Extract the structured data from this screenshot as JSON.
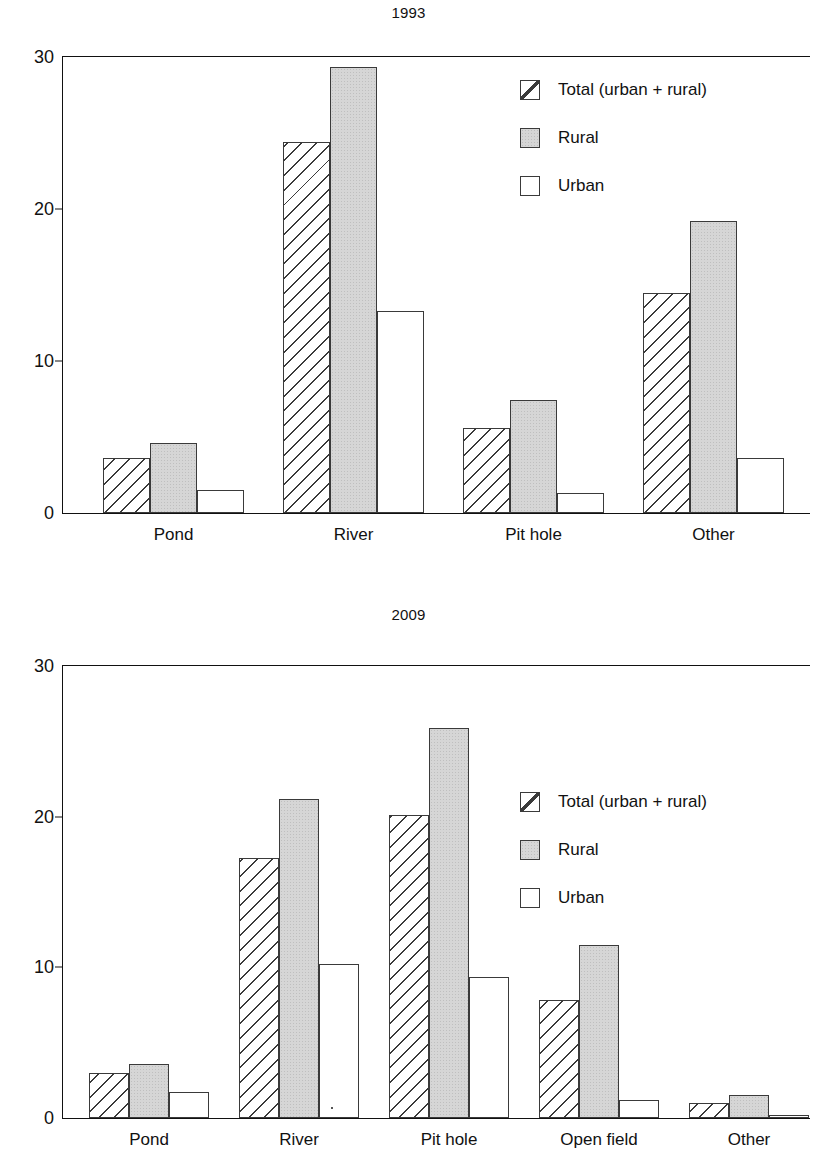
{
  "figures": [
    {
      "id": "1993",
      "title": "1993",
      "legend_position": "top-right"
    },
    {
      "id": "2009",
      "title": "2009",
      "legend_position": "top-right"
    }
  ],
  "legend": {
    "items": [
      {
        "key": "total",
        "label": "Total (urban + rural)",
        "swatch": "hatched-swatch"
      },
      {
        "key": "rural",
        "label": "Rural",
        "swatch": "gray-filled-swatch"
      },
      {
        "key": "urban",
        "label": "Urban",
        "swatch": "white-swatch"
      }
    ]
  },
  "axis": {
    "y_ticks": [
      "0",
      "10",
      "20",
      "30"
    ],
    "y_min": 0,
    "y_max": 30
  },
  "chart_data": [
    {
      "type": "bar",
      "title": "1993",
      "xlabel": "",
      "ylabel": "",
      "ylim": [
        0,
        30
      ],
      "yticks": [
        0,
        10,
        20,
        30
      ],
      "grid": false,
      "legend": "top right",
      "categories": [
        "Pond",
        "River",
        "Pit hole",
        "Other"
      ],
      "series": [
        {
          "name": "Total (urban + rural)",
          "values": [
            3.6,
            24.3,
            5.6,
            14.4
          ]
        },
        {
          "name": "Rural",
          "values": [
            4.6,
            29.2,
            7.4,
            19.1
          ]
        },
        {
          "name": "Urban",
          "values": [
            1.5,
            13.2,
            1.3,
            3.6
          ]
        }
      ]
    },
    {
      "type": "bar",
      "title": "2009",
      "xlabel": "",
      "ylabel": "",
      "ylim": [
        0,
        30
      ],
      "yticks": [
        0,
        10,
        20,
        30
      ],
      "grid": false,
      "legend": "top right",
      "categories": [
        "Pond",
        "River",
        "Pit hole",
        "Open field",
        "Other"
      ],
      "series": [
        {
          "name": "Total (urban + rural)",
          "values": [
            3.0,
            17.2,
            20.0,
            7.8,
            1.0
          ]
        },
        {
          "name": "Rural",
          "values": [
            3.6,
            21.1,
            25.8,
            11.4,
            1.5
          ]
        },
        {
          "name": "Urban",
          "values": [
            1.7,
            10.2,
            9.3,
            1.2,
            0.2
          ]
        }
      ]
    }
  ]
}
